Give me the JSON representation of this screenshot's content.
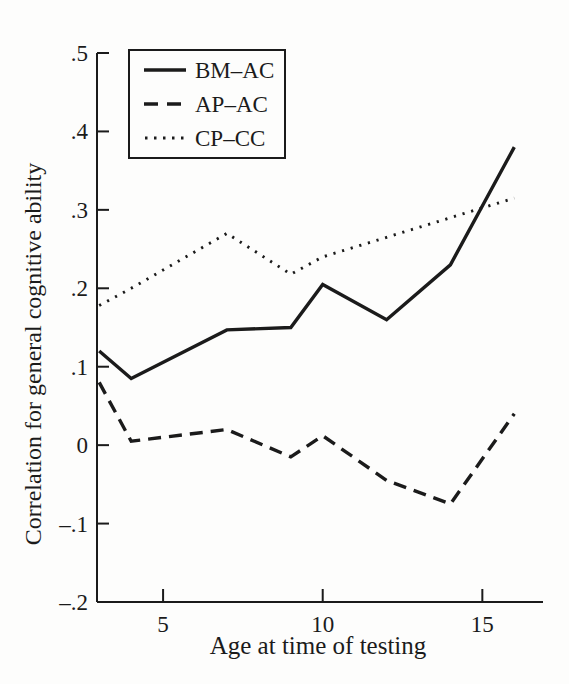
{
  "figure": {
    "background": "#fdfdfc",
    "ink_color": "#1b1b1b"
  },
  "chart_data": {
    "type": "line",
    "title": "",
    "xlabel": "Age at time of testing",
    "ylabel": "Correlation for general cognitive ability",
    "x": [
      3,
      4,
      7,
      9,
      10,
      12,
      14,
      16
    ],
    "series": [
      {
        "name": "BM–AC",
        "style": "solid",
        "values": [
          0.12,
          0.085,
          0.147,
          0.15,
          0.205,
          0.16,
          0.23,
          0.38
        ]
      },
      {
        "name": "AP–AC",
        "style": "dashed",
        "values": [
          0.08,
          0.005,
          0.02,
          -0.015,
          0.012,
          -0.045,
          -0.075,
          0.04
        ]
      },
      {
        "name": "CP–CC",
        "style": "dotted",
        "values": [
          0.178,
          0.2,
          0.27,
          0.218,
          0.24,
          0.265,
          0.29,
          0.315
        ]
      }
    ],
    "xlim": [
      2.93,
      16.9
    ],
    "ylim": [
      -0.2,
      0.5
    ],
    "xticks": {
      "values": [
        5,
        10,
        15
      ],
      "labels": [
        "5",
        "10",
        "15"
      ]
    },
    "yticks": {
      "values": [
        0.5,
        0.4,
        0.3,
        0.2,
        0.1,
        0,
        -0.1,
        -0.2
      ],
      "labels": [
        ".5",
        ".4",
        ".3",
        ".2",
        ".1",
        "0",
        "–.1",
        "–.2"
      ]
    },
    "grid": false,
    "legend": {
      "position": "upper-left",
      "entries": [
        "BM–AC",
        "AP–AC",
        "CP–CC"
      ]
    }
  }
}
